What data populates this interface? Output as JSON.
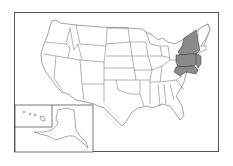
{
  "map": {
    "type": "us-states-outline",
    "highlight_color": "#8a8a8a",
    "fill_color": "#ffffff",
    "stroke_color": "#444444",
    "highlighted_region": [
      "New York",
      "Pennsylvania",
      "New Jersey",
      "Delaware",
      "Maryland"
    ],
    "insets": [
      "Alaska",
      "Hawaii"
    ]
  }
}
